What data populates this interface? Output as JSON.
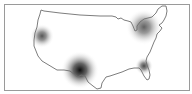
{
  "map": {
    "type": "heatmap",
    "region": "United States (contiguous)",
    "frame_color": "#9a9a9a",
    "outline_color": "#6e6e6e",
    "background": "#ffffff",
    "hotspots": [
      {
        "name": "west-coast",
        "cx": 42,
        "cy": 36,
        "r": 12,
        "intensity": 0.7
      },
      {
        "name": "southwest",
        "cx": 80,
        "cy": 70,
        "r": 19,
        "intensity": 1.0
      },
      {
        "name": "northeast",
        "cx": 144,
        "cy": 27,
        "r": 18,
        "intensity": 0.65
      },
      {
        "name": "florida",
        "cx": 144,
        "cy": 66,
        "r": 9,
        "intensity": 0.75
      }
    ]
  }
}
